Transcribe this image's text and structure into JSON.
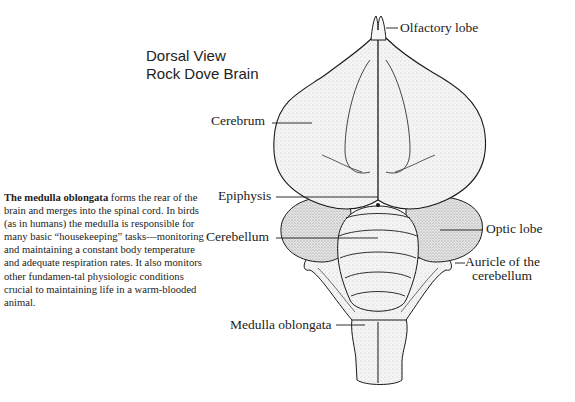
{
  "title": {
    "line1": "Dorsal View",
    "line2": "Rock Dove Brain"
  },
  "caption": {
    "bold_lead": "The medulla oblongata",
    "text": " forms the rear of the brain and merges into the spinal cord. In birds (as in humans) the medulla is responsible for many basic “housekeeping” tasks—monitoring and maintaining a constant body temperature and adequate respiration rates. It also monitors other fundamen-tal physiologic conditions crucial to maintaining life in a warm-blooded animal."
  },
  "labels": {
    "olfactory_lobe": "Olfactory lobe",
    "cerebrum": "Cerebrum",
    "epiphysis": "Epiphysis",
    "cerebellum": "Cerebellum",
    "optic_lobe": "Optic lobe",
    "auricle_line1": "Auricle of the",
    "auricle_line2": "cerebellum",
    "medulla_oblongata": "Medulla oblongata"
  },
  "colors": {
    "outline": "#1a1a1a",
    "fill": "#f4f4f4",
    "shade": "#dcdcdc",
    "text": "#222222"
  }
}
